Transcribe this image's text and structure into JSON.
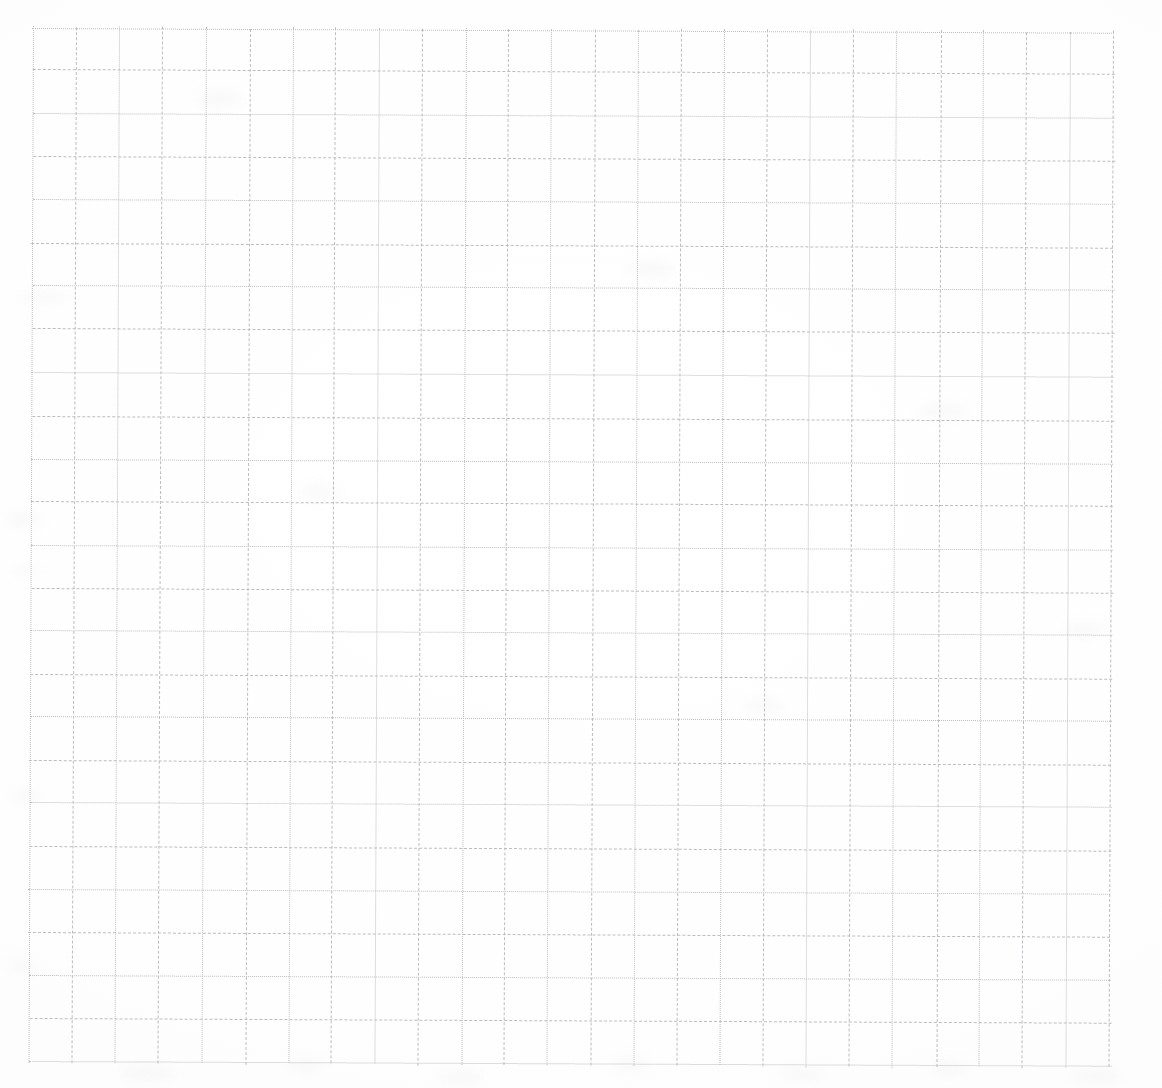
{
  "document": {
    "kind": "scanned-grid-paper",
    "title": "Grid Paper Scan",
    "page_width": 1162,
    "page_height": 1088,
    "background_color": "#fefefe"
  },
  "grid": {
    "line_color": "#bdbcc4",
    "line_style": "dotted",
    "line_width": 1,
    "origin_x": 33,
    "origin_y": 27,
    "cell_width": 43.2,
    "cell_height": 43.1,
    "columns": 25,
    "rows": 24,
    "vertical_line_count": 26,
    "horizontal_line_count": 25,
    "right_edge_x": 1127,
    "bottom_edge_y": 1043,
    "skew_degrees": 0.25
  },
  "smudges": [
    {
      "x": 18,
      "y": 292,
      "w": 52,
      "h": 10
    },
    {
      "x": 6,
      "y": 512,
      "w": 34,
      "h": 14
    },
    {
      "x": 14,
      "y": 566,
      "w": 26,
      "h": 10
    },
    {
      "x": 10,
      "y": 790,
      "w": 30,
      "h": 12
    },
    {
      "x": 8,
      "y": 960,
      "w": 28,
      "h": 12
    },
    {
      "x": 196,
      "y": 92,
      "w": 46,
      "h": 14
    },
    {
      "x": 300,
      "y": 486,
      "w": 40,
      "h": 12
    },
    {
      "x": 628,
      "y": 262,
      "w": 48,
      "h": 14
    },
    {
      "x": 742,
      "y": 700,
      "w": 44,
      "h": 12
    },
    {
      "x": 918,
      "y": 404,
      "w": 50,
      "h": 14
    },
    {
      "x": 1064,
      "y": 624,
      "w": 42,
      "h": 12
    },
    {
      "x": 120,
      "y": 1066,
      "w": 56,
      "h": 14
    },
    {
      "x": 286,
      "y": 1060,
      "w": 40,
      "h": 12
    },
    {
      "x": 438,
      "y": 1072,
      "w": 44,
      "h": 12
    },
    {
      "x": 612,
      "y": 1058,
      "w": 38,
      "h": 12
    },
    {
      "x": 780,
      "y": 1068,
      "w": 46,
      "h": 12
    },
    {
      "x": 930,
      "y": 1062,
      "w": 40,
      "h": 12
    },
    {
      "x": 1072,
      "y": 1070,
      "w": 48,
      "h": 12
    }
  ]
}
